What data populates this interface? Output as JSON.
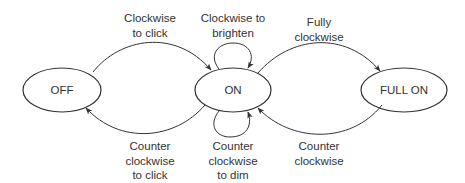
{
  "diagram": {
    "type": "state-machine",
    "states": [
      {
        "id": "off",
        "label": "OFF"
      },
      {
        "id": "on",
        "label": "ON"
      },
      {
        "id": "full_on",
        "label": "FULL ON"
      }
    ],
    "transitions": [
      {
        "from": "off",
        "to": "on",
        "label_lines": [
          "Clockwise",
          "to click"
        ]
      },
      {
        "from": "on",
        "to": "off",
        "label_lines": [
          "Counter",
          "clockwise",
          "to click"
        ]
      },
      {
        "from": "on",
        "to": "on",
        "position": "top",
        "label_lines": [
          "Clockwise to",
          "brighten"
        ]
      },
      {
        "from": "on",
        "to": "on",
        "position": "bottom",
        "label_lines": [
          "Counter",
          "clockwise",
          "to dim"
        ]
      },
      {
        "from": "on",
        "to": "full_on",
        "label_lines": [
          "Fully",
          "clockwise"
        ]
      },
      {
        "from": "full_on",
        "to": "on",
        "label_lines": [
          "Counter",
          "clockwise"
        ]
      }
    ]
  },
  "colors": {
    "stroke": "#333333",
    "text": "#333333",
    "background": "#ffffff"
  }
}
